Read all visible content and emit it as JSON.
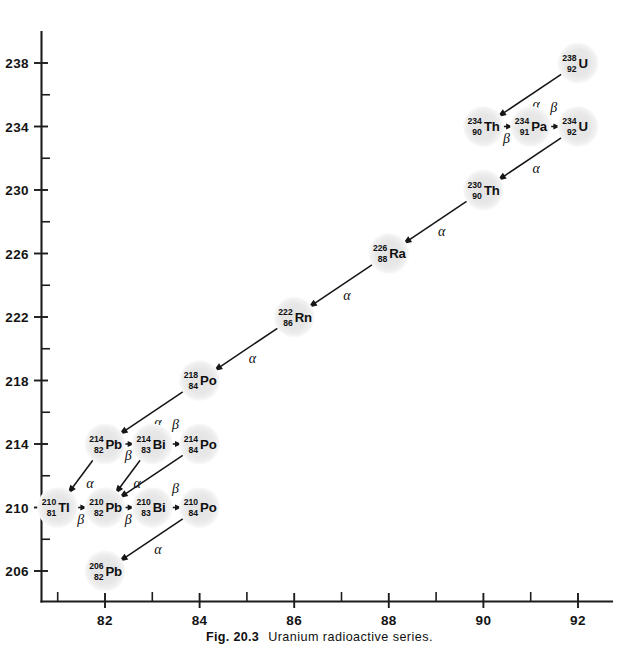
{
  "figure": {
    "caption_label": "Fig. 20.3",
    "caption_title": "Uranium radioactive series.",
    "node_fill": "#e9e9e9",
    "ink_color": "#161616"
  },
  "chart_data": {
    "type": "scatter",
    "title": "Uranium radioactive series",
    "xlabel": "",
    "ylabel": "",
    "xlim": [
      80.6,
      92.8
    ],
    "ylim": [
      204.3,
      239.6
    ],
    "grid": false,
    "legend": null,
    "x_ticks_major": [
      82,
      84,
      86,
      88,
      90,
      92
    ],
    "x_ticks_minor": [
      81,
      83,
      85,
      87,
      89,
      91
    ],
    "y_ticks_major": [
      206,
      210,
      214,
      218,
      222,
      226,
      230,
      234,
      238
    ],
    "y_ticks_minor": [
      208,
      212,
      216,
      220,
      224,
      228,
      232,
      236
    ],
    "x_tick_labels": [
      "82",
      "84",
      "86",
      "88",
      "90",
      "92"
    ],
    "y_tick_labels": [
      "206",
      "210",
      "214",
      "218",
      "222",
      "226",
      "230",
      "234",
      "238"
    ],
    "nodes": [
      {
        "id": "U238",
        "symbol": "U",
        "mass": "238",
        "atomic": "92",
        "x": 92,
        "y": 238
      },
      {
        "id": "Th234",
        "symbol": "Th",
        "mass": "234",
        "atomic": "90",
        "x": 90,
        "y": 234
      },
      {
        "id": "Pa234",
        "symbol": "Pa",
        "mass": "234",
        "atomic": "91",
        "x": 91,
        "y": 234
      },
      {
        "id": "U234",
        "symbol": "U",
        "mass": "234",
        "atomic": "92",
        "x": 92,
        "y": 234
      },
      {
        "id": "Th230",
        "symbol": "Th",
        "mass": "230",
        "atomic": "90",
        "x": 90,
        "y": 230
      },
      {
        "id": "Ra226",
        "symbol": "Ra",
        "mass": "226",
        "atomic": "88",
        "x": 88,
        "y": 226
      },
      {
        "id": "Rn222",
        "symbol": "Rn",
        "mass": "222",
        "atomic": "86",
        "x": 86,
        "y": 222
      },
      {
        "id": "Po218",
        "symbol": "Po",
        "mass": "218",
        "atomic": "84",
        "x": 84,
        "y": 218
      },
      {
        "id": "Pb214",
        "symbol": "Pb",
        "mass": "214",
        "atomic": "82",
        "x": 82,
        "y": 214
      },
      {
        "id": "Bi214",
        "symbol": "Bi",
        "mass": "214",
        "atomic": "83",
        "x": 83,
        "y": 214
      },
      {
        "id": "Po214",
        "symbol": "Po",
        "mass": "214",
        "atomic": "84",
        "x": 84,
        "y": 214
      },
      {
        "id": "Tl210",
        "symbol": "Tl",
        "mass": "210",
        "atomic": "81",
        "x": 81,
        "y": 210
      },
      {
        "id": "Pb210",
        "symbol": "Pb",
        "mass": "210",
        "atomic": "82",
        "x": 82,
        "y": 210
      },
      {
        "id": "Bi210",
        "symbol": "Bi",
        "mass": "210",
        "atomic": "83",
        "x": 83,
        "y": 210
      },
      {
        "id": "Po210",
        "symbol": "Po",
        "mass": "210",
        "atomic": "84",
        "x": 84,
        "y": 210
      },
      {
        "id": "Pb206",
        "symbol": "Pb",
        "mass": "206",
        "atomic": "82",
        "x": 82,
        "y": 206
      }
    ],
    "transitions": [
      {
        "from": "U238",
        "to": "Th234",
        "label": "α",
        "type": "alpha",
        "label_side": "above"
      },
      {
        "from": "Th234",
        "to": "Pa234",
        "label": "β",
        "type": "beta",
        "label_side": "below"
      },
      {
        "from": "Pa234",
        "to": "U234",
        "label": "β",
        "type": "beta",
        "label_side": "above"
      },
      {
        "from": "U234",
        "to": "Th230",
        "label": "α",
        "type": "alpha",
        "label_side": "above"
      },
      {
        "from": "Th230",
        "to": "Ra226",
        "label": "α",
        "type": "alpha",
        "label_side": "above"
      },
      {
        "from": "Ra226",
        "to": "Rn222",
        "label": "α",
        "type": "alpha",
        "label_side": "above"
      },
      {
        "from": "Rn222",
        "to": "Po218",
        "label": "α",
        "type": "alpha",
        "label_side": "above"
      },
      {
        "from": "Po218",
        "to": "Pb214",
        "label": "α",
        "type": "alpha",
        "label_side": "above"
      },
      {
        "from": "Pb214",
        "to": "Bi214",
        "label": "β",
        "type": "beta",
        "label_side": "below"
      },
      {
        "from": "Bi214",
        "to": "Po214",
        "label": "β",
        "type": "beta",
        "label_side": "above"
      },
      {
        "from": "Pb214",
        "to": "Tl210",
        "label": "α",
        "type": "alpha",
        "label_side": "above"
      },
      {
        "from": "Bi214",
        "to": "Pb210",
        "label": "α",
        "type": "alpha",
        "label_side": "above"
      },
      {
        "from": "Po214",
        "to": "Pb210",
        "label": "",
        "type": "alpha",
        "label_side": "above"
      },
      {
        "from": "Tl210",
        "to": "Pb210",
        "label": "β",
        "type": "beta",
        "label_side": "below"
      },
      {
        "from": "Pb210",
        "to": "Bi210",
        "label": "β",
        "type": "beta",
        "label_side": "below"
      },
      {
        "from": "Bi210",
        "to": "Po210",
        "label": "β",
        "type": "beta",
        "label_side": "above"
      },
      {
        "from": "Po210",
        "to": "Pb206",
        "label": "α",
        "type": "alpha",
        "label_side": "above"
      }
    ]
  }
}
